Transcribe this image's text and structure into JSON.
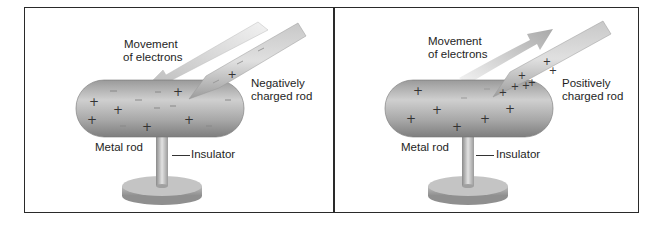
{
  "panels": [
    {
      "id": "left",
      "labels": {
        "movement_line1": "Movement",
        "movement_line2": "of electrons",
        "rod_line1": "Negatively",
        "rod_line2": "charged rod",
        "metal_rod": "Metal rod",
        "insulator": "Insulator"
      },
      "arrow_direction": "toward metal rod",
      "charged_rod_charge": "negative"
    },
    {
      "id": "right",
      "labels": {
        "movement_line1": "Movement",
        "movement_line2": "of electrons",
        "rod_line1": "Positively",
        "rod_line2": "charged rod",
        "metal_rod": "Metal rod",
        "insulator": "Insulator"
      },
      "arrow_direction": "away from metal rod",
      "charged_rod_charge": "positive"
    }
  ],
  "colors": {
    "border": "#2a2a2a",
    "rod_dark": "#8c8c8c",
    "rod_light": "#d6d6d6",
    "text": "#1e1e1e"
  }
}
